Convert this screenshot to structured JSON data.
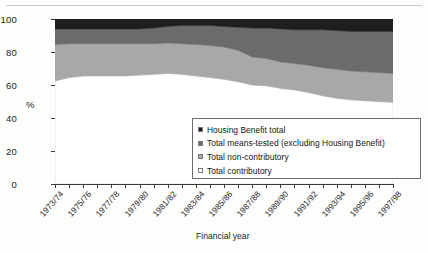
{
  "chart_data": {
    "type": "area",
    "stacked": true,
    "title": "",
    "xlabel": "Financial year",
    "ylabel": "%",
    "ylim": [
      0,
      100
    ],
    "yticks": [
      0,
      20,
      40,
      60,
      80,
      100
    ],
    "grid": false,
    "legend_position": "inside-bottom-right",
    "x": [
      "1973/74",
      "1974/75",
      "1975/76",
      "1976/77",
      "1977/78",
      "1978/79",
      "1979/80",
      "1980/81",
      "1981/82",
      "1982/83",
      "1983/84",
      "1984/85",
      "1985/86",
      "1986/87",
      "1987/88",
      "1988/89",
      "1989/90",
      "1990/91",
      "1991/92",
      "1992/93",
      "1993/94",
      "1994/95",
      "1995/96",
      "1996/97",
      "1997/98"
    ],
    "xtick_labels": [
      "1973/74",
      "1975/76",
      "1977/78",
      "1979/80",
      "1981/82",
      "1983/84",
      "1985/86",
      "1987/88",
      "1989/90",
      "1991/92",
      "1993/94",
      "1995/96",
      "1997/98"
    ],
    "series": [
      {
        "name": "Total contributory",
        "color": "#ffffff",
        "values": [
          62.5,
          64.5,
          65.5,
          65.5,
          65.5,
          65.5,
          66.0,
          66.5,
          67.0,
          66.5,
          65.5,
          64.5,
          63.5,
          62.0,
          60.0,
          59.5,
          58.0,
          57.0,
          55.5,
          53.5,
          52.0,
          51.0,
          50.5,
          50.0,
          49.5
        ]
      },
      {
        "name": "Total non-contributory",
        "color": "#a8a8a8",
        "values": [
          22.0,
          20.5,
          19.5,
          19.5,
          19.5,
          19.5,
          19.0,
          18.5,
          18.5,
          18.5,
          19.0,
          19.5,
          19.5,
          19.0,
          17.0,
          16.5,
          16.0,
          16.0,
          16.5,
          17.0,
          17.5,
          17.5,
          17.5,
          17.5,
          17.5
        ]
      },
      {
        "name": "Total means-tested (excluding Housing Benefit)",
        "color": "#6b6b6b",
        "values": [
          9.5,
          9.0,
          9.0,
          9.0,
          9.0,
          9.0,
          9.0,
          9.5,
          10.0,
          11.0,
          11.5,
          12.0,
          12.5,
          14.0,
          17.5,
          18.5,
          20.0,
          20.5,
          21.5,
          23.0,
          23.5,
          24.0,
          24.5,
          25.0,
          25.5
        ]
      },
      {
        "name": "Housing Benefit total",
        "color": "#1e1e1e",
        "values": [
          6.0,
          6.0,
          6.0,
          6.0,
          6.0,
          6.0,
          6.0,
          5.5,
          4.5,
          4.0,
          4.0,
          4.0,
          4.5,
          5.0,
          5.5,
          5.5,
          6.0,
          6.5,
          6.5,
          6.5,
          7.0,
          7.5,
          7.5,
          7.5,
          7.5
        ]
      }
    ],
    "legend_entries": [
      {
        "label": "Housing Benefit total",
        "color": "#1e1e1e"
      },
      {
        "label": "Total means-tested (excluding Housing Benefit)",
        "color": "#6b6b6b"
      },
      {
        "label": "Total non-contributory",
        "color": "#a8a8a8"
      },
      {
        "label": "Total contributory",
        "color": "#ffffff"
      }
    ]
  }
}
